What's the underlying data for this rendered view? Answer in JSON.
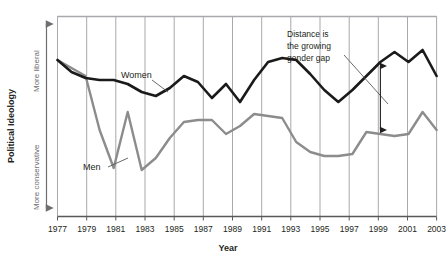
{
  "chart_data": {
    "type": "line",
    "title": "",
    "xlabel": "Year",
    "ylabel": "Political Ideology",
    "grid": "vertical gridlines at odd years",
    "legend_position": "inline series labels on plot",
    "xlim": [
      1977,
      2004
    ],
    "ylim": [
      0,
      100
    ],
    "axis_direction_top": "More liberal",
    "axis_direction_bottom": "More conservative",
    "x": [
      1977,
      1978,
      1979,
      1980,
      1981,
      1982,
      1983,
      1984,
      1985,
      1986,
      1987,
      1988,
      1989,
      1990,
      1991,
      1992,
      1993,
      1994,
      1995,
      1996,
      1997,
      1998,
      1999,
      2000,
      2001,
      2002,
      2003,
      2004
    ],
    "xticks": [
      "1977",
      "1979",
      "1981",
      "1983",
      "1985",
      "1987",
      "1989",
      "1991",
      "1993",
      "1995",
      "1997",
      "1999",
      "2001",
      "2003"
    ],
    "series": [
      {
        "name": "Women",
        "color": "#1a1a1a",
        "values": [
          78,
          72,
          69,
          68,
          68,
          66,
          62,
          60,
          64,
          70,
          67,
          59,
          66,
          57,
          68,
          77,
          79,
          78,
          71,
          63,
          57,
          63,
          70,
          77,
          82,
          77,
          83,
          70
        ]
      },
      {
        "name": "Men",
        "color": "#8c8c8c",
        "values": [
          78,
          74,
          70,
          43,
          24,
          52,
          23,
          29,
          39,
          47,
          48,
          48,
          41,
          45,
          51,
          50,
          49,
          37,
          32,
          30,
          30,
          31,
          42,
          41,
          40,
          41,
          52,
          43
        ]
      }
    ],
    "annotations": [
      {
        "name": "gender-gap-note",
        "text_lines": [
          "Distance is",
          "the growing",
          "gender gap"
        ],
        "leader": "diagonal line pointing down-right toward the gap arrow"
      },
      {
        "name": "gap-double-arrow",
        "at_year": 2000,
        "description": "double-headed vertical arrow spanning between the Men and Women lines"
      }
    ]
  },
  "labels": {
    "series_women": "Women",
    "series_men": "Men",
    "x_axis_title": "Year",
    "y_axis_title": "Political Ideology",
    "y_top": "More liberal",
    "y_bottom": "More conservative",
    "annotation_line1": "Distance is",
    "annotation_line2": "the growing",
    "annotation_line3": "gender gap"
  },
  "ticks": {
    "x": [
      "1977",
      "1979",
      "1981",
      "1983",
      "1985",
      "1987",
      "1989",
      "1991",
      "1993",
      "1995",
      "1997",
      "1999",
      "2001",
      "2003"
    ]
  },
  "colors": {
    "women_line": "#1a1a1a",
    "men_line": "#8c8c8c",
    "gridline": "#a7a9ac",
    "axis": "#58595b",
    "text": "#231f20",
    "muted_text": "#6d6e71",
    "background": "#ffffff"
  }
}
